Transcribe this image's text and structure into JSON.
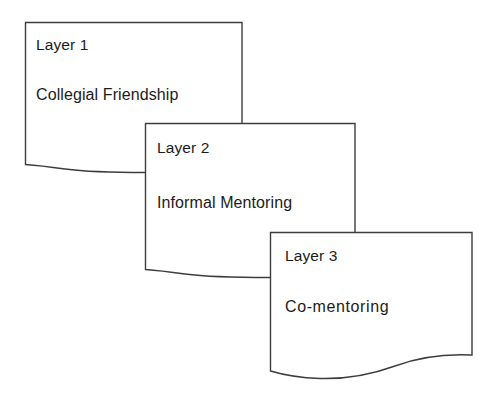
{
  "diagram": {
    "type": "stacked-layers",
    "stroke_color": "#3d3d3d",
    "fill_color": "#ffffff",
    "text_color": "#1c1c1c",
    "background_color": "#ffffff",
    "layers": [
      {
        "id": "layer-1",
        "title": "Layer 1",
        "description": "Collegial Friendship"
      },
      {
        "id": "layer-2",
        "title": "Layer 2",
        "description": "Informal Mentoring"
      },
      {
        "id": "layer-3",
        "title": "Layer 3",
        "description": "Co-mentoring"
      }
    ]
  }
}
